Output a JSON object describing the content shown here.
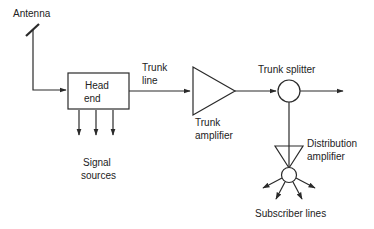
{
  "diagram": {
    "type": "cable-tv-distribution-system",
    "colors": {
      "line": "#2a2a2a",
      "text": "#222222",
      "background": "#ffffff"
    },
    "labels": {
      "antenna": "Antenna",
      "head_end_line1": "Head",
      "head_end_line2": "end",
      "trunk_line_line1": "Trunk",
      "trunk_line_line2": "line",
      "trunk_amplifier_line1": "Trunk",
      "trunk_amplifier_line2": "amplifier",
      "trunk_splitter": "Trunk splitter",
      "distribution_amplifier_line1": "Distribution",
      "distribution_amplifier_line2": "amplifier",
      "signal_sources_line1": "Signal",
      "signal_sources_line2": "sources",
      "subscriber_lines": "Subscriber lines"
    },
    "nodes": [
      {
        "id": "antenna",
        "label": "Antenna"
      },
      {
        "id": "head_end",
        "label": "Head end"
      },
      {
        "id": "trunk_amplifier",
        "label": "Trunk amplifier"
      },
      {
        "id": "trunk_splitter",
        "label": "Trunk splitter"
      },
      {
        "id": "distribution_amplifier",
        "label": "Distribution amplifier"
      },
      {
        "id": "signal_sources",
        "label": "Signal sources"
      },
      {
        "id": "subscriber_lines",
        "label": "Subscriber lines"
      }
    ],
    "edges": [
      {
        "from": "antenna",
        "to": "head_end"
      },
      {
        "from": "signal_sources",
        "to": "head_end",
        "count": 3
      },
      {
        "from": "head_end",
        "to": "trunk_amplifier",
        "label": "Trunk line"
      },
      {
        "from": "trunk_amplifier",
        "to": "trunk_splitter"
      },
      {
        "from": "trunk_splitter",
        "to": "continuation"
      },
      {
        "from": "trunk_splitter",
        "to": "distribution_amplifier"
      },
      {
        "from": "distribution_amplifier",
        "to": "subscriber_lines",
        "count": 4
      }
    ]
  }
}
